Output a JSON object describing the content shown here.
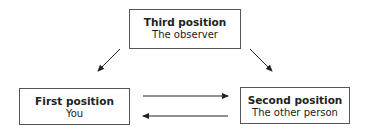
{
  "diagram": {
    "nodes": [
      {
        "id": "third",
        "title": "Third position",
        "subtitle": "The observer"
      },
      {
        "id": "first",
        "title": "First position",
        "subtitle": "You"
      },
      {
        "id": "second",
        "title": "Second position",
        "subtitle": "The other person"
      }
    ],
    "edges": [
      {
        "from": "third",
        "to": "first"
      },
      {
        "from": "third",
        "to": "second"
      },
      {
        "from": "first",
        "to": "second"
      },
      {
        "from": "second",
        "to": "first"
      }
    ],
    "colors": {
      "line": "#222222",
      "border": "#555555",
      "background": "#ffffff"
    }
  }
}
